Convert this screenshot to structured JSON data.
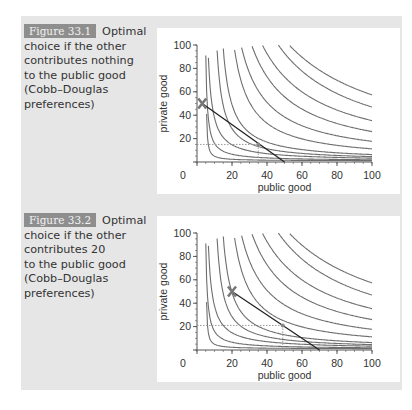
{
  "figures": [
    {
      "label": "Figure 33.1",
      "caption_first": "Optimal",
      "caption_rest": [
        "choice if the other",
        "contributes nothing",
        "to the public good",
        "(Cobb–Douglas",
        "preferences)"
      ]
    },
    {
      "label": "Figure 33.2",
      "caption_first": "Optimal",
      "caption_rest": [
        "choice if the other",
        "contributes 20",
        "to the public good",
        "(Cobb–Douglas",
        "preferences)"
      ]
    }
  ],
  "chart_data": [
    {
      "type": "line",
      "title": "Optimal choice if the other contributes nothing to the public good (Cobb–Douglas preferences)",
      "xlabel": "public good",
      "ylabel": "private good",
      "xlim": [
        0,
        100
      ],
      "ylim": [
        0,
        100
      ],
      "xticks": [
        "0",
        "20",
        "40",
        "60",
        "80",
        "100"
      ],
      "yticks": [
        "20",
        "40",
        "60",
        "80",
        "100"
      ],
      "grid": false,
      "budget_line": {
        "x": [
          3,
          50
        ],
        "y": [
          50,
          0
        ]
      },
      "endowment_marker": {
        "x": 3,
        "y": 50,
        "symbol": "X"
      },
      "optimum": {
        "x": 35,
        "y": 15
      },
      "indifference_curves": "family of Cobb–Douglas curves x*y = k",
      "other_contribution": 0
    },
    {
      "type": "line",
      "title": "Optimal choice if the other contributes 20 to the public good (Cobb–Douglas preferences)",
      "xlabel": "public good",
      "ylabel": "private good",
      "xlim": [
        0,
        100
      ],
      "ylim": [
        0,
        100
      ],
      "xticks": [
        "0",
        "20",
        "40",
        "60",
        "80",
        "100"
      ],
      "yticks": [
        "20",
        "40",
        "60",
        "80",
        "100"
      ],
      "grid": false,
      "budget_line": {
        "x": [
          20,
          70
        ],
        "y": [
          50,
          0
        ]
      },
      "endowment_marker": {
        "x": 20,
        "y": 50,
        "symbol": "X"
      },
      "optimum": {
        "x": 49,
        "y": 21
      },
      "indifference_curves": "family of Cobb–Douglas curves x*y = k",
      "other_contribution": 20
    }
  ]
}
